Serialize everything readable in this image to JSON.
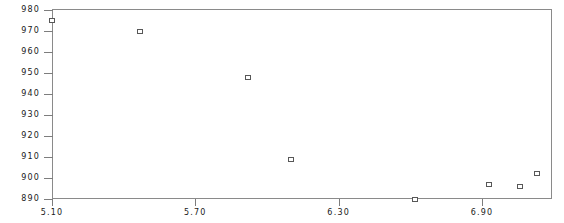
{
  "chart_data": {
    "type": "scatter",
    "title": "",
    "subtitle": "",
    "xlabel": "",
    "ylabel": "",
    "grid": false,
    "legend": null,
    "marker_style": "open-square",
    "marker_color": "#575757",
    "axis_color": "#8a8a8a",
    "background_color": "#ffffff",
    "xlim": [
      5.1,
      6.93
    ],
    "ylim": [
      890,
      980
    ],
    "x_ticks": [
      5.1,
      5.7,
      6.3,
      6.9
    ],
    "x_tick_labels": [
      "5.10",
      "5.70",
      "6.30",
      "6.90"
    ],
    "y_ticks": [
      890,
      900,
      910,
      920,
      930,
      940,
      950,
      960,
      970,
      980
    ],
    "y_tick_labels": [
      "890",
      "900",
      "910",
      "920",
      "930",
      "940",
      "950",
      "960",
      "970",
      "980"
    ],
    "points": [
      {
        "x": 5.1,
        "y": 975
      },
      {
        "x": 5.47,
        "y": 970
      },
      {
        "x": 5.92,
        "y": 948
      },
      {
        "x": 6.1,
        "y": 909
      },
      {
        "x": 6.62,
        "y": 890
      },
      {
        "x": 6.93,
        "y": 897
      },
      {
        "x": 7.06,
        "y": 896
      },
      {
        "x": 7.13,
        "y": 902
      }
    ]
  }
}
